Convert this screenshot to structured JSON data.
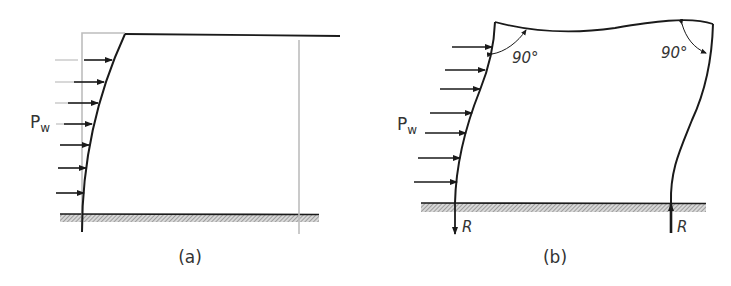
{
  "figure": {
    "panels": [
      {
        "id": "a",
        "caption": "(a)",
        "load_label_main": "P",
        "load_label_sub": "w",
        "load_arrow_count": 7,
        "description": "Single-bay frame with rigid-jointed beam; left column deflects under wind pressure, undeformed position shown in light gray"
      },
      {
        "id": "b",
        "caption": "(b)",
        "load_label_main": "P",
        "load_label_sub": "w",
        "load_arrow_count": 7,
        "angle_left": "90°",
        "angle_right": "90°",
        "reaction_left": "R",
        "reaction_right": "R",
        "description": "Portal frame with rigid joints deforming under wind load; 90° angles preserved at joints; equal and opposite vertical reactions R"
      }
    ],
    "colors": {
      "line": "#1a1a1a",
      "undeformed": "#bdbdbd",
      "hatch": "#9a9a9a",
      "text": "#333333"
    }
  }
}
